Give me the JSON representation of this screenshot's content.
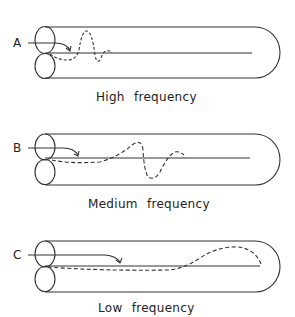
{
  "panels": [
    {
      "letter": "A",
      "caption": "High frequency"
    },
    {
      "letter": "B",
      "caption": "Medium frequency"
    },
    {
      "letter": "C",
      "caption": "Low frequency"
    }
  ],
  "colors": {
    "stroke": "#333333",
    "background": "#ffffff"
  }
}
